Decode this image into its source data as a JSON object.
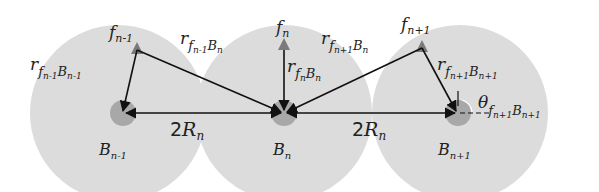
{
  "diagram": {
    "colors": {
      "region": "#dcdcdc",
      "bs_dot": "#a8a8a8",
      "femto_marker": "#7a7a7a",
      "line": "#222222",
      "background": "#ffffff"
    },
    "cells": [
      {
        "id": "B_{n-1}",
        "center": [
          123,
          113
        ],
        "radius": 88,
        "label_main": "B",
        "label_sub": "n-1"
      },
      {
        "id": "B_n",
        "center": [
          284,
          113
        ],
        "radius": 88,
        "label_main": "B",
        "label_sub": "n"
      },
      {
        "id": "B_{n+1}",
        "center": [
          458,
          113
        ],
        "radius": 88,
        "label_main": "B",
        "label_sub": "n+1"
      }
    ],
    "femtocells": [
      {
        "id": "f_{n-1}",
        "pos": [
          137,
          50
        ],
        "label_main": "f",
        "label_sub": "n-1"
      },
      {
        "id": "f_n",
        "pos": [
          284,
          46
        ],
        "label_main": "f",
        "label_sub": "n"
      },
      {
        "id": "f_{n+1}",
        "pos": [
          422,
          48
        ],
        "label_main": "f",
        "label_sub": "n+1"
      }
    ],
    "distance_labels": [
      {
        "id": "r_fn-1_Bn-1",
        "main": "r",
        "sub": "f",
        "subsub": "n-1",
        "tail": "B",
        "tailsub": "n-1"
      },
      {
        "id": "r_fn-1_Bn",
        "main": "r",
        "sub": "f",
        "subsub": "n-1",
        "tail": "B",
        "tailsub": "n"
      },
      {
        "id": "r_fn_Bn",
        "main": "r",
        "sub": "f",
        "subsub": "n",
        "tail": "B",
        "tailsub": "n"
      },
      {
        "id": "r_fn+1_Bn",
        "main": "r",
        "sub": "f",
        "subsub": "n+1",
        "tail": "B",
        "tailsub": "n"
      },
      {
        "id": "r_fn+1_Bn+1",
        "main": "r",
        "sub": "f",
        "subsub": "n+1",
        "tail": "B",
        "tailsub": "n+1"
      }
    ],
    "spacing_labels": [
      {
        "id": "left",
        "text_num": "2",
        "text_main": "R",
        "text_sub": "n"
      },
      {
        "id": "right",
        "text_num": "2",
        "text_main": "R",
        "text_sub": "n"
      }
    ],
    "angle_label": {
      "main": "θ",
      "sub": "f",
      "subsub": "n+1",
      "tail": "B",
      "tailsub": "n+1"
    }
  }
}
